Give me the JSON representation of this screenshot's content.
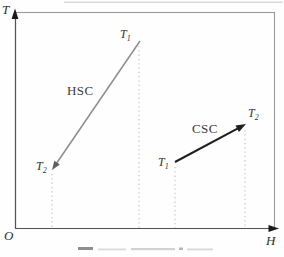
{
  "figure": {
    "axes": {
      "y_label": "T",
      "x_label": "H",
      "origin_label": "O"
    },
    "curves": [
      {
        "id": "HSC",
        "label": "HSC",
        "from": {
          "base": "T",
          "sub": "1"
        },
        "to": {
          "base": "T",
          "sub": "2"
        },
        "color": "#8d8d8d",
        "arrow_color": "#5f5f5f",
        "direction": "down-left"
      },
      {
        "id": "CSC",
        "label": "CSC",
        "from": {
          "base": "T",
          "sub": "1"
        },
        "to": {
          "base": "T",
          "sub": "2"
        },
        "color": "#1f1f1f",
        "arrow_color": "#1f1f1f",
        "direction": "up-right"
      }
    ],
    "colors": {
      "frame": "#9a9a9a",
      "axis_line": "#555555",
      "axis_arrow": "#1a1a1a",
      "guide_dots": "#c0c0c0"
    }
  }
}
